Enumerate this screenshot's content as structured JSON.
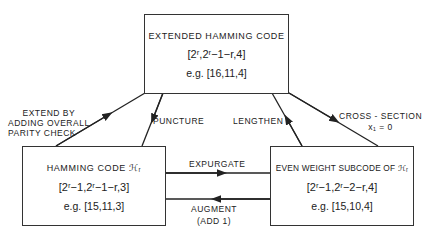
{
  "nodes": {
    "extended": {
      "title": "EXTENDED HAMMING CODE",
      "formula": "[2ʳ,2ʳ−1−r,4]",
      "example": "e.g. [16,11,4]"
    },
    "hamming": {
      "title": "HAMMING CODE ℋᵣ",
      "formula": "[2ʳ−1,2ʳ−1−r,3]",
      "example": "e.g.  [15,11,3]"
    },
    "even_weight": {
      "title": "EVEN WEIGHT SUBCODE OF ℋᵣ",
      "formula": "[2ʳ−1,2ʳ−2−r,4]",
      "example": "e.g.  [15,10,4]"
    }
  },
  "edges": {
    "extend": [
      "EXTEND BY",
      "ADDING OVERALL",
      "PARITY CHECK"
    ],
    "puncture": "PUNCTURE",
    "lengthen": "LENGTHEN",
    "cross_section": [
      "CROSS - SECTION",
      "x₁ = 0"
    ],
    "expurgate": "EXPURGATE",
    "augment": [
      "AUGMENT",
      "(ADD 1)"
    ]
  }
}
